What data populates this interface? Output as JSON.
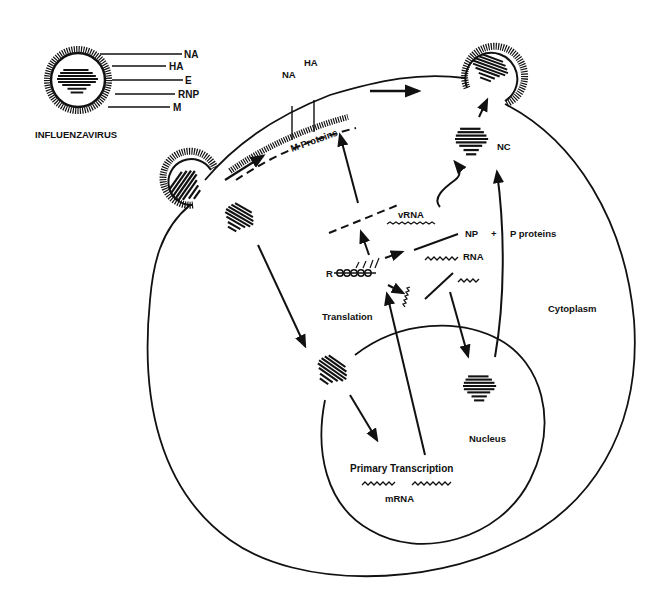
{
  "legend_virion": {
    "name": "INFLUENZAVIRUS",
    "parts": [
      {
        "label": "NA",
        "meaning": "neuraminidase"
      },
      {
        "label": "HA",
        "meaning": "hemagglutinin"
      },
      {
        "label": "E",
        "meaning": "envelope"
      },
      {
        "label": "RNP",
        "meaning": "ribonucleoprotein"
      },
      {
        "label": "M",
        "meaning": "matrix protein"
      }
    ]
  },
  "membrane_labels": {
    "na": "NA",
    "ha": "HA",
    "m_proteins": "M Protoins"
  },
  "cytoplasm_labels": {
    "vrna": "vRNA",
    "np": "NP",
    "plus": "+",
    "p_proteins": "P proteins",
    "rna": "RNA",
    "ribosome": "R",
    "translation": "Translation",
    "nc": "NC",
    "cytoplasm": "Cytoplasm"
  },
  "nucleus_labels": {
    "nucleus": "Nucleus",
    "primary_transcription": "Primary Transcription",
    "mrna": "mRNA"
  },
  "colors": {
    "ink": "#111111",
    "background": "#ffffff"
  }
}
